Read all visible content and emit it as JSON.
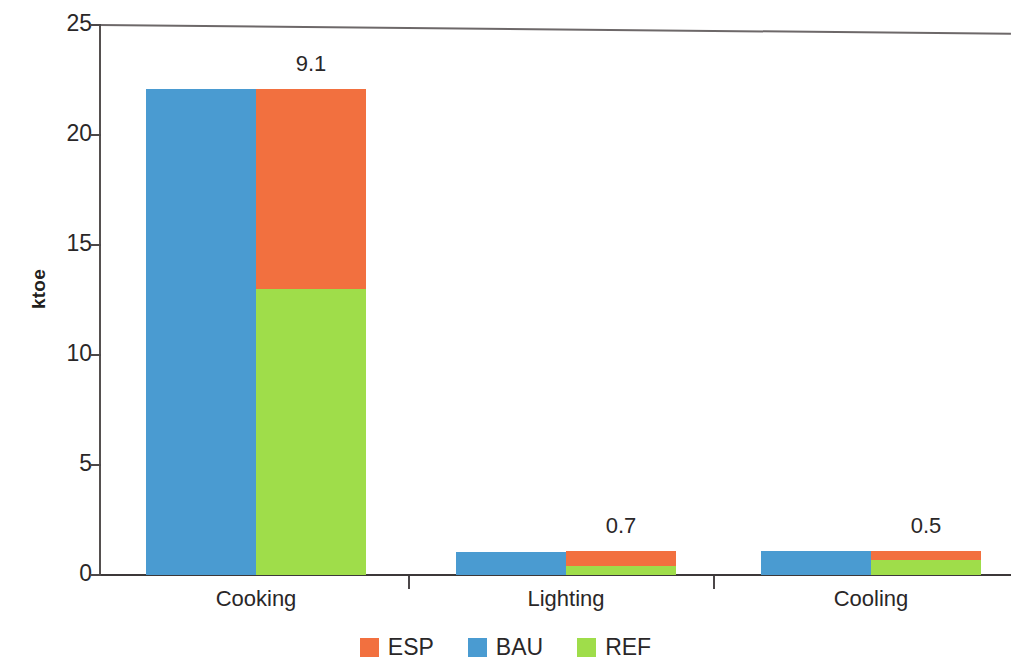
{
  "chart_data": {
    "type": "bar",
    "subtype": "grouped-stacked",
    "title": "",
    "xlabel": "",
    "ylabel": "ktoe",
    "ylim": [
      0,
      25
    ],
    "yticks": [
      0,
      5,
      10,
      15,
      20,
      25
    ],
    "ytick_labels": [
      "0",
      "5",
      "10",
      "15",
      "20",
      "25"
    ],
    "grid": false,
    "legend_position": "bottom",
    "categories": [
      "Cooking",
      "Lighting",
      "Cooling"
    ],
    "series": [
      {
        "name": "ESP",
        "color": "#F2703F",
        "values": [
          9.1,
          0.7,
          0.5
        ]
      },
      {
        "name": "BAU",
        "color": "#4A9BD1",
        "values": [
          22.1,
          1.05,
          1.1
        ]
      },
      {
        "name": "REF",
        "color": "#9FDD4A",
        "values": [
          13.0,
          0.4,
          0.7
        ]
      }
    ],
    "groups": [
      {
        "category": "Cooking",
        "bau": 22.1,
        "ref": 13.0,
        "esp": 9.1,
        "stack_total": 22.1,
        "value_label": "9.1"
      },
      {
        "category": "Lighting",
        "bau": 1.05,
        "ref": 0.4,
        "esp": 0.7,
        "stack_total": 1.1,
        "value_label": "0.7"
      },
      {
        "category": "Cooling",
        "bau": 1.1,
        "ref": 0.7,
        "esp": 0.5,
        "stack_total": 1.1,
        "value_label": "0.5"
      }
    ]
  },
  "axes": {
    "y_title": "ktoe",
    "ticks": [
      {
        "label": "25",
        "value": 25
      },
      {
        "label": "20",
        "value": 20
      },
      {
        "label": "15",
        "value": 15
      },
      {
        "label": "10",
        "value": 10
      },
      {
        "label": "5",
        "value": 5
      },
      {
        "label": "0",
        "value": 0
      }
    ]
  },
  "legend": {
    "items": [
      {
        "label": "ESP",
        "color": "#F2703F"
      },
      {
        "label": "BAU",
        "color": "#4A9BD1"
      },
      {
        "label": "REF",
        "color": "#9FDD4A"
      }
    ]
  },
  "colors": {
    "esp": "#F2703F",
    "bau": "#4A9BD1",
    "ref": "#9FDD4A",
    "axis": "#3c3839",
    "text": "#2a2728",
    "background": "#ffffff"
  }
}
